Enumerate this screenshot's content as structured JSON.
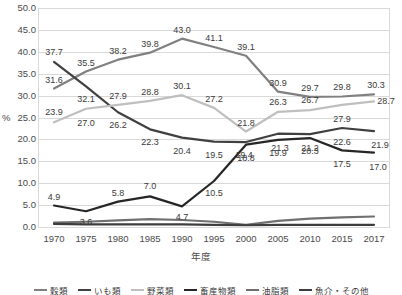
{
  "chart_data": {
    "type": "line",
    "title": "",
    "xlabel": "年度",
    "ylabel": "%",
    "ylim": [
      0.0,
      50.0
    ],
    "ytick_step": 5.0,
    "grid": true,
    "legend_position": "bottom",
    "categories": [
      "1970",
      "1975",
      "1980",
      "1985",
      "1990",
      "1995",
      "2000",
      "2005",
      "2010",
      "2015",
      "2017"
    ],
    "yticks": [
      "0.0",
      "5.0",
      "10.0",
      "15.0",
      "20.0",
      "25.0",
      "30.0",
      "35.0",
      "40.0",
      "45.0",
      "50.0"
    ],
    "series": [
      {
        "name": "穀類",
        "color": "#808080",
        "values": [
          31.6,
          35.5,
          38.2,
          39.8,
          43.0,
          41.1,
          39.1,
          30.9,
          29.7,
          29.8,
          30.3
        ],
        "labels": [
          "31.6",
          "35.5",
          "38.2",
          "39.8",
          "43.0",
          "41.1",
          "39.1",
          "30.9",
          "29.7",
          "29.8",
          "30.3"
        ]
      },
      {
        "name": "いも類",
        "color": "#404040",
        "values": [
          37.7,
          32.1,
          26.2,
          22.3,
          20.4,
          19.5,
          19.4,
          21.3,
          21.2,
          22.6,
          21.9
        ],
        "labels": [
          "37.7",
          "32.1",
          "26.2",
          "22.3",
          "20.4",
          "19.5",
          "19.4",
          "21.3",
          "21.2",
          "22.6",
          "21.9"
        ]
      },
      {
        "name": "野菜類",
        "color": "#bfbfbf",
        "values": [
          23.9,
          27.0,
          27.9,
          28.8,
          30.1,
          27.2,
          21.8,
          26.3,
          26.7,
          27.9,
          28.7
        ],
        "labels": [
          "23.9",
          "27.0",
          "27.9",
          "28.8",
          "30.1",
          "27.2",
          "21.8",
          "26.3",
          "26.7",
          "27.9",
          "28.7"
        ]
      },
      {
        "name": "畜産物類",
        "color": "#262626",
        "values": [
          4.9,
          3.6,
          5.8,
          7.0,
          4.7,
          10.5,
          18.8,
          19.9,
          20.3,
          17.5,
          17.0
        ],
        "labels": [
          "4.9",
          "3.6",
          "5.8",
          "7.0",
          "4.7",
          "10.5",
          "18.8",
          "19.9",
          "20.3",
          "17.5",
          "17.0"
        ]
      },
      {
        "name": "油脂類",
        "color": "#707070",
        "values": [
          1.0,
          1.2,
          1.5,
          1.8,
          1.6,
          1.2,
          0.5,
          1.4,
          1.9,
          2.2,
          2.4
        ],
        "labels": [
          "",
          "",
          "",
          "",
          "",
          "",
          "",
          "",
          "",
          "",
          ""
        ]
      },
      {
        "name": "魚介・その他",
        "color": "#3d3d3d",
        "values": [
          0.7,
          0.6,
          0.6,
          0.6,
          0.6,
          0.5,
          0.4,
          0.5,
          0.5,
          0.5,
          0.5
        ],
        "labels": [
          "",
          "",
          "",
          "",
          "",
          "",
          "",
          "",
          "",
          "",
          ""
        ]
      }
    ]
  }
}
